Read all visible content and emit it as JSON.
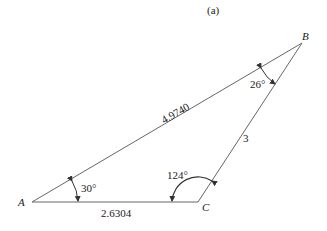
{
  "figure": {
    "caption": "(a)",
    "vertices": {
      "A": {
        "label": "A",
        "x": 32,
        "y": 202
      },
      "B": {
        "label": "B",
        "x": 302,
        "y": 43
      },
      "C": {
        "label": "C",
        "x": 198,
        "y": 202
      }
    },
    "sides": {
      "AB": {
        "label": "4.9740"
      },
      "BC": {
        "label": "3"
      },
      "AC": {
        "label": "2.6304"
      }
    },
    "angles": {
      "A": {
        "label": "30°"
      },
      "B": {
        "label": "26°"
      },
      "C": {
        "label": "124°"
      }
    },
    "line_color": "#555555"
  }
}
